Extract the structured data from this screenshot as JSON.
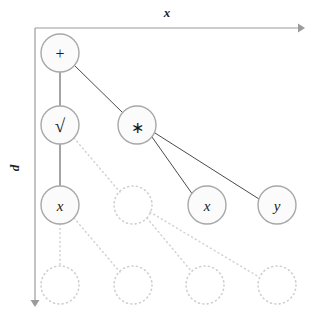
{
  "figure": {
    "background_color": "#ffffff",
    "width": 315,
    "height": 320
  },
  "axes": {
    "horizontal": {
      "label": "x",
      "direction": "right",
      "start": [
        35,
        28
      ],
      "end": [
        300,
        28
      ],
      "color": "#9b9b9b",
      "label_pos": [
        167,
        16
      ]
    },
    "vertical": {
      "label": "d",
      "direction": "down",
      "start": [
        35,
        28
      ],
      "end": [
        35,
        303
      ],
      "color": "#9b9b9b",
      "label_pos": [
        19,
        168
      ],
      "label_rotation": -90
    }
  },
  "grid": {
    "columns_x": [
      60,
      133,
      205,
      277
    ],
    "rows_y": [
      53,
      125,
      205,
      285
    ],
    "node_radius": 19,
    "ghost_radius": 19
  },
  "nodes": [
    {
      "id": "n-plus",
      "label": "+",
      "kind": "operator",
      "state": "filled",
      "col": 0,
      "row": 0,
      "cx": 60,
      "cy": 53,
      "r": 19
    },
    {
      "id": "n-sqrt",
      "label": "√",
      "kind": "operator",
      "state": "filled",
      "col": 0,
      "row": 1,
      "cx": 60,
      "cy": 125,
      "r": 19
    },
    {
      "id": "n-mul",
      "label": "∗",
      "kind": "operator",
      "state": "filled",
      "col": 1,
      "row": 1,
      "cx": 137,
      "cy": 125,
      "r": 19
    },
    {
      "id": "n-x-left",
      "label": "x",
      "kind": "variable",
      "state": "filled",
      "col": 0,
      "row": 2,
      "cx": 60,
      "cy": 205,
      "r": 19
    },
    {
      "id": "n-x-right",
      "label": "x",
      "kind": "variable",
      "state": "filled",
      "col": 2,
      "row": 2,
      "cx": 207,
      "cy": 205,
      "r": 19
    },
    {
      "id": "n-y",
      "label": "y",
      "kind": "variable",
      "state": "filled",
      "col": 3,
      "row": 2,
      "cx": 277,
      "cy": 205,
      "r": 19
    },
    {
      "id": "ghost-r2-c1",
      "label": "",
      "kind": "placeholder",
      "state": "ghost",
      "col": 1,
      "row": 2,
      "cx": 133,
      "cy": 205,
      "r": 19
    },
    {
      "id": "ghost-r3-c0",
      "label": "",
      "kind": "placeholder",
      "state": "ghost",
      "col": 0,
      "row": 3,
      "cx": 60,
      "cy": 285,
      "r": 19
    },
    {
      "id": "ghost-r3-c1",
      "label": "",
      "kind": "placeholder",
      "state": "ghost",
      "col": 1,
      "row": 3,
      "cx": 133,
      "cy": 285,
      "r": 19
    },
    {
      "id": "ghost-r3-c2",
      "label": "",
      "kind": "placeholder",
      "state": "ghost",
      "col": 2,
      "row": 3,
      "cx": 205,
      "cy": 285,
      "r": 19
    },
    {
      "id": "ghost-r3-c3",
      "label": "",
      "kind": "placeholder",
      "state": "ghost",
      "col": 3,
      "row": 3,
      "cx": 277,
      "cy": 285,
      "r": 19
    }
  ],
  "edges": [
    {
      "id": "e-plus-sqrt",
      "from": "n-plus",
      "to": "n-sqrt",
      "style": "solid",
      "x1": 60,
      "y1": 72,
      "x2": 60,
      "y2": 106
    },
    {
      "id": "e-plus-mul",
      "from": "n-plus",
      "to": "n-mul",
      "style": "solid",
      "x1": 75,
      "y1": 64,
      "x2": 122,
      "y2": 114
    },
    {
      "id": "e-sqrt-x",
      "from": "n-sqrt",
      "to": "n-x-left",
      "style": "solid",
      "x1": 60,
      "y1": 144,
      "x2": 60,
      "y2": 186
    },
    {
      "id": "e-mul-xright",
      "from": "n-mul",
      "to": "n-x-right",
      "style": "solid",
      "x1": 152,
      "y1": 137,
      "x2": 192,
      "y2": 196
    },
    {
      "id": "e-mul-y",
      "from": "n-mul",
      "to": "n-y",
      "style": "solid",
      "x1": 154,
      "y1": 133,
      "x2": 259,
      "y2": 199
    },
    {
      "id": "e-sqrt-ghost",
      "from": "n-sqrt",
      "to": "ghost-r2-c1",
      "style": "ghost",
      "x1": 74,
      "y1": 138,
      "x2": 120,
      "y2": 192
    },
    {
      "id": "e-xleft-ghost0",
      "from": "n-x-left",
      "to": "ghost-r3-c0",
      "style": "ghost",
      "x1": 60,
      "y1": 224,
      "x2": 60,
      "y2": 266
    },
    {
      "id": "e-xleft-ghost1",
      "from": "n-x-left",
      "to": "ghost-r3-c1",
      "style": "ghost",
      "x1": 74,
      "y1": 218,
      "x2": 120,
      "y2": 272
    },
    {
      "id": "e-ghost-r2c1-ghost2",
      "from": "ghost-r2-c1",
      "to": "ghost-r3-c2",
      "style": "ghost",
      "x1": 147,
      "y1": 218,
      "x2": 192,
      "y2": 272
    },
    {
      "id": "e-ghost-r2c1-ghost3",
      "from": "ghost-r2-c1",
      "to": "ghost-r3-c3",
      "style": "ghost",
      "x1": 150,
      "y1": 212,
      "x2": 259,
      "y2": 277
    }
  ],
  "legend": {
    "solid_node_meaning": "realized node",
    "ghost_node_meaning": "potential node"
  }
}
